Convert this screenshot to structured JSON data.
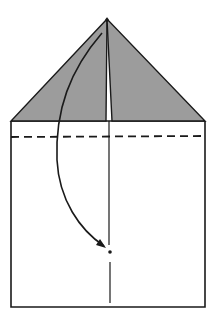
{
  "diagram": {
    "type": "origami-fold-instruction",
    "colors": {
      "background": "#ffffff",
      "stroke": "#1a1a1a",
      "flap_fill": "#9c9c9c"
    },
    "paper": {
      "left": 11,
      "right": 205,
      "base_y": 121,
      "bottom_y": 307
    },
    "apex": {
      "x": 107,
      "y": 19
    },
    "flaps": {
      "left_inner_x": 106,
      "right_inner_x": 112
    },
    "center_line": {
      "x": 109,
      "segments": [
        {
          "y1": 121,
          "y2": 245
        },
        {
          "y1": 262,
          "y2": 303
        }
      ]
    },
    "fold_line": {
      "style": "dashed",
      "y": 137,
      "dash": "8 5"
    },
    "arrow": {
      "start": {
        "x": 102,
        "y": 33
      },
      "end": {
        "x": 106,
        "y": 247
      },
      "meaning": "fold apex down to marked point"
    },
    "target_point": {
      "x": 110,
      "y": 252
    }
  }
}
